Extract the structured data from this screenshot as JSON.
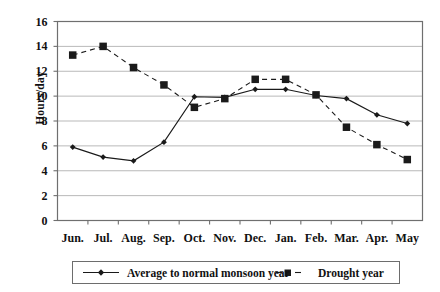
{
  "chart_data": {
    "type": "line",
    "title": "",
    "xlabel": "",
    "ylabel": "Hours/day",
    "categories": [
      "Jun.",
      "Jul.",
      "Aug.",
      "Sep.",
      "Oct.",
      "Nov.",
      "Dec.",
      "Jan.",
      "Feb.",
      "Mar.",
      "Apr.",
      "May"
    ],
    "ylim": [
      0,
      16
    ],
    "ytick_values": [
      16,
      14,
      12,
      10,
      8,
      6,
      4,
      2,
      0
    ],
    "ytick_labels": [
      "16",
      "14",
      "12",
      "10",
      "8",
      "6",
      "4",
      "2",
      "0"
    ],
    "grid": "horizontal",
    "legend_position": "bottom",
    "series": [
      {
        "name": "Average to normal monsoon year",
        "marker": "diamond",
        "line_style": "solid",
        "color": "#1a1a1a",
        "values": [
          5.9,
          5.1,
          4.8,
          6.3,
          9.95,
          9.9,
          10.55,
          10.55,
          10.05,
          9.8,
          8.5,
          7.8
        ]
      },
      {
        "name": "Drought year",
        "marker": "square",
        "line_style": "dashed",
        "color": "#1a1a1a",
        "values": [
          13.3,
          14.0,
          12.3,
          10.9,
          9.1,
          9.8,
          11.35,
          11.35,
          10.1,
          7.5,
          6.1,
          4.9
        ]
      }
    ]
  },
  "axis": {
    "y_label": "Hours/day"
  },
  "legend": {
    "items": [
      {
        "label": "Average to normal monsoon year"
      },
      {
        "label": "Drought year"
      }
    ]
  }
}
